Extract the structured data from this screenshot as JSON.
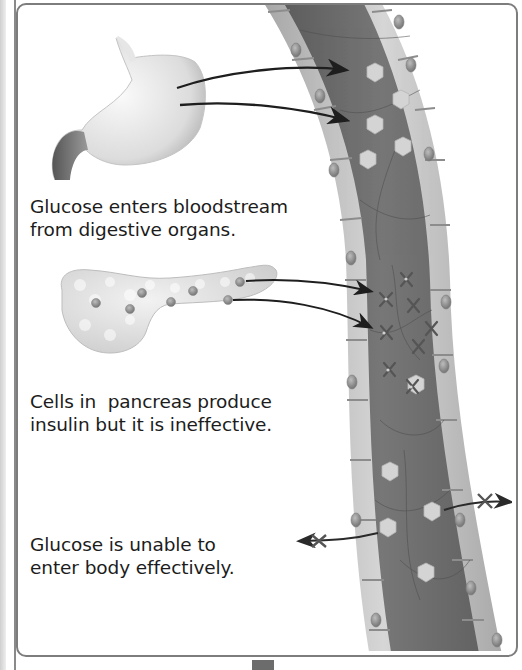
{
  "diagram": {
    "captions": {
      "digestive": {
        "line1": "Glucose enters bloodstream",
        "line2": "from digestive organs."
      },
      "pancreas": {
        "line1": "Cells in  pancreas produce",
        "line2": "insulin but it is ineffective."
      },
      "uptake": {
        "line1": "Glucose is unable to",
        "line2": "enter body effectively."
      }
    },
    "elements": [
      {
        "name": "stomach",
        "label": "stomach-illustration"
      },
      {
        "name": "pancreas",
        "label": "pancreas-illustration"
      },
      {
        "name": "blood-vessel",
        "label": "blood-vessel-cross-section"
      },
      {
        "name": "glucose",
        "shape": "hexagon",
        "count": 9
      },
      {
        "name": "insulin",
        "shape": "x-mark",
        "count": 8
      },
      {
        "name": "blocked-arrows",
        "count": 2
      }
    ],
    "colors": {
      "vessel_lumen": "#6e6e6e",
      "vessel_wall": "#bdbdbd",
      "glucose": "#d4d4d4",
      "insulin": "#5a5a5a",
      "arrow": "#1e1e1e",
      "frame": "#7d7d7d",
      "text": "#1c1c1c"
    }
  }
}
